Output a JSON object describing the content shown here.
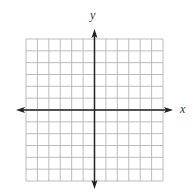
{
  "diagram": {
    "type": "coordinate-plane",
    "x_axis_label": "x",
    "y_axis_label": "y",
    "grid": {
      "columns": 12,
      "rows": 12,
      "columns_left_of_y_axis": 6,
      "columns_right_of_y_axis": 6,
      "rows_above_x_axis": 6,
      "rows_below_x_axis": 6,
      "left": 26,
      "top": 39,
      "right": 163,
      "bottom": 181
    },
    "origin": {
      "x": 94,
      "y": 110
    },
    "x_axis": {
      "y": 110,
      "left_arrow_tip": 16,
      "right_arrow_tip": 173
    },
    "y_axis": {
      "x": 94,
      "top_arrow_tip": 29,
      "bottom_arrow_tip": 189
    },
    "colors": {
      "background": "#ffffff",
      "grid_line": "#b4b4b4",
      "axis_line": "#222222",
      "label": "#333333"
    },
    "arrows": [
      "left",
      "right",
      "up",
      "down"
    ]
  }
}
